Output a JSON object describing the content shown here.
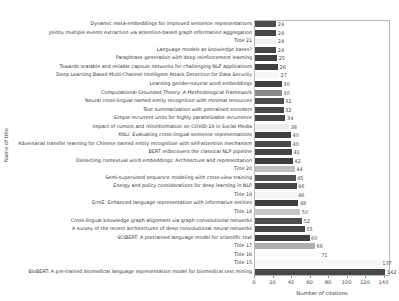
{
  "chart_data": {
    "type": "bar",
    "orientation": "horizontal",
    "title": "",
    "xlabel": "Number of citations",
    "ylabel": "Name of title",
    "xlim": [
      0,
      147
    ],
    "xticks": [
      0,
      20,
      40,
      60,
      80,
      100,
      120,
      140
    ],
    "grid": false,
    "legend": null,
    "value_labels_shown": true,
    "bar_color_dark_default": "#474747",
    "bars": [
      {
        "label": "Dynamic meta-embeddings for improved sentence representations",
        "value": 24,
        "color": "#4d4d4d"
      },
      {
        "label": "Jointly multiple events extraction via attention-based graph information aggregation",
        "value": 24,
        "color": "#464646"
      },
      {
        "label": "Title 21",
        "value": 24,
        "color": "#f1f1f1"
      },
      {
        "label": "Language models as knowledge bases?",
        "value": 24,
        "color": "#474747"
      },
      {
        "label": "Paraphrase generation with deep reinforcement learning",
        "value": 25,
        "color": "#414141"
      },
      {
        "label": "Towards scalable and reliable capsule networks for challenging NLP applications",
        "value": 26,
        "color": "#3f3f3f"
      },
      {
        "label": "Deep Learning Based Multi-Channel Intelligent Attack Detection for Data Security",
        "value": 27,
        "color": "#f6f6f6"
      },
      {
        "label": "Learning gender-neutral word embeddings",
        "value": 30,
        "color": "#424242"
      },
      {
        "label": "Computational Grounded Theory: A Methodological Framework",
        "value": 30,
        "color": "#8a8a8a"
      },
      {
        "label": "Neural cross-lingual named entity recognition with minimal resources",
        "value": 32,
        "color": "#4c4c4c"
      },
      {
        "label": "Text summarization with pretrained encoders",
        "value": 32,
        "color": "#484848"
      },
      {
        "label": "Simple recurrent units for highly parallelizable recurrence",
        "value": 34,
        "color": "#454545"
      },
      {
        "label": "Impact of rumors and misinformation on COVID-19 in Social Media",
        "value": 38,
        "color": "#ececec"
      },
      {
        "label": "XNLI: Evaluating cross-lingual sentence representations",
        "value": 40,
        "color": "#404040"
      },
      {
        "label": "Adversarial transfer learning for Chinese named entity recognition with self-attention mechanism",
        "value": 40,
        "color": "#4a4a4a"
      },
      {
        "label": "BERT rediscovers the classical NLP pipeline",
        "value": 41,
        "color": "#444444"
      },
      {
        "label": "Dissecting contextual word embeddings: Architecture and representation",
        "value": 42,
        "color": "#3e3e3e"
      },
      {
        "label": "Title 20",
        "value": 44,
        "color": "#bfbfbf"
      },
      {
        "label": "Semi-supervised sequence modeling with cross-view training",
        "value": 45,
        "color": "#525252"
      },
      {
        "label": "Energy and policy considerations for deep learning in NLP",
        "value": 46,
        "color": "#464646"
      },
      {
        "label": "Title 19",
        "value": 46,
        "color": "#f3f3f3"
      },
      {
        "label": "ErnIE: Enhanced language representation with informative entities",
        "value": 48,
        "color": "#3d3d3d"
      },
      {
        "label": "Title 18",
        "value": 50,
        "color": "#c6c6c6"
      },
      {
        "label": "Cross-lingual knowledge graph alignment via graph convolutional networks",
        "value": 52,
        "color": "#4e4e4e"
      },
      {
        "label": "A survey of the recent architectures of deep convolutional neural networks",
        "value": 55,
        "color": "#434343"
      },
      {
        "label": "SCIBERT: A pretrained language model for scientific text",
        "value": 60,
        "color": "#3f3f3f"
      },
      {
        "label": "Title 17",
        "value": 66,
        "color": "#aeaeae"
      },
      {
        "label": "Title 16",
        "value": 71,
        "color": "#fbfbfb"
      },
      {
        "label": "Title 15",
        "value": 137,
        "color": "#f5f5f5"
      },
      {
        "label": "BioBERT: A pre-trained biomedical language representation model for biomedical text mining",
        "value": 142,
        "color": "#484848"
      }
    ]
  }
}
